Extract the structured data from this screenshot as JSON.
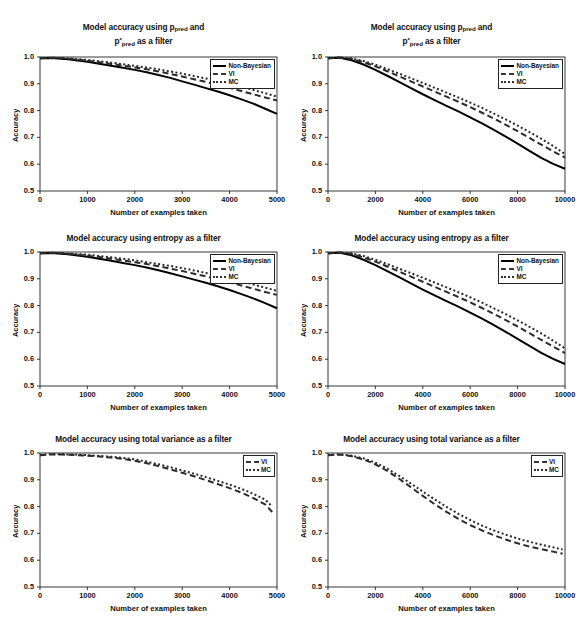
{
  "figure": {
    "axis_labels": {
      "x": "Number of examples taken",
      "y": "Accuracy"
    },
    "series_names": {
      "nonbayes": "Non-Bayesian",
      "vi": "VI",
      "mc": "MC"
    }
  },
  "titles": {
    "ppred_line1_a": "Model accuracy using p",
    "ppred_line1_sub": "pred",
    "ppred_line1_b": " and",
    "ppred_line2_a": "p",
    "ppred_line2_sup": "*",
    "ppred_line2_sub": "pred",
    "ppred_line2_b": " as a filter",
    "entropy": "Model accuracy using entropy as a filter",
    "variance": "Model accuracy using total variance as a filter"
  },
  "ticks": {
    "y": [
      "1.0",
      "0.9",
      "0.8",
      "0.7",
      "0.6",
      "0.5"
    ],
    "x5000": [
      "0",
      "1000",
      "2000",
      "3000",
      "4000",
      "5000"
    ],
    "x10000": [
      "0",
      "2000",
      "4000",
      "6000",
      "8000",
      "10000"
    ]
  },
  "chart_data": [
    {
      "id": "ppred-5000",
      "type": "line",
      "title": "Model accuracy using p_pred and p*_pred as a filter",
      "xlabel": "Number of examples taken",
      "ylabel": "Accuracy",
      "xlim": [
        0,
        5000
      ],
      "ylim": [
        0.5,
        1.0
      ],
      "xticks": [
        0,
        1000,
        2000,
        3000,
        4000,
        5000
      ],
      "yticks": [
        0.5,
        0.6,
        0.7,
        0.8,
        0.9,
        1.0
      ],
      "grid": false,
      "legend_position": "top-right",
      "x": [
        0,
        250,
        500,
        750,
        1000,
        1250,
        1500,
        1750,
        2000,
        2250,
        2500,
        2750,
        3000,
        3250,
        3500,
        3750,
        4000,
        4250,
        4500,
        4750,
        5000
      ],
      "series": [
        {
          "name": "Non-Bayesian",
          "style": "solid",
          "values": [
            0.995,
            0.996,
            0.993,
            0.988,
            0.982,
            0.975,
            0.967,
            0.96,
            0.952,
            0.943,
            0.933,
            0.922,
            0.909,
            0.897,
            0.884,
            0.871,
            0.857,
            0.842,
            0.826,
            0.807,
            0.788
          ]
        },
        {
          "name": "VI",
          "style": "dashed",
          "values": [
            0.995,
            0.997,
            0.995,
            0.991,
            0.986,
            0.98,
            0.974,
            0.968,
            0.961,
            0.954,
            0.946,
            0.937,
            0.927,
            0.917,
            0.907,
            0.896,
            0.885,
            0.873,
            0.861,
            0.849,
            0.838
          ]
        },
        {
          "name": "MC",
          "style": "dotted",
          "values": [
            0.995,
            0.997,
            0.996,
            0.993,
            0.989,
            0.984,
            0.979,
            0.973,
            0.967,
            0.961,
            0.954,
            0.946,
            0.938,
            0.929,
            0.92,
            0.91,
            0.9,
            0.889,
            0.877,
            0.865,
            0.852
          ]
        }
      ]
    },
    {
      "id": "ppred-10000",
      "type": "line",
      "title": "Model accuracy using p_pred and p*_pred as a filter",
      "xlabel": "Number of examples taken",
      "ylabel": "Accuracy",
      "xlim": [
        0,
        10000
      ],
      "ylim": [
        0.5,
        1.0
      ],
      "xticks": [
        0,
        2000,
        4000,
        6000,
        8000,
        10000
      ],
      "yticks": [
        0.5,
        0.6,
        0.7,
        0.8,
        0.9,
        1.0
      ],
      "grid": false,
      "legend_position": "top-right",
      "x": [
        0,
        500,
        1000,
        1500,
        2000,
        2500,
        3000,
        3500,
        4000,
        4500,
        5000,
        5500,
        6000,
        6500,
        7000,
        7500,
        8000,
        8500,
        9000,
        9500,
        10000
      ],
      "series": [
        {
          "name": "Non-Bayesian",
          "style": "solid",
          "values": [
            0.995,
            0.997,
            0.988,
            0.972,
            0.952,
            0.93,
            0.907,
            0.884,
            0.861,
            0.839,
            0.818,
            0.797,
            0.775,
            0.752,
            0.728,
            0.703,
            0.677,
            0.65,
            0.624,
            0.601,
            0.583
          ]
        },
        {
          "name": "VI",
          "style": "dashed",
          "values": [
            0.995,
            0.998,
            0.993,
            0.981,
            0.965,
            0.947,
            0.928,
            0.909,
            0.89,
            0.871,
            0.852,
            0.833,
            0.813,
            0.792,
            0.77,
            0.747,
            0.723,
            0.698,
            0.673,
            0.648,
            0.625
          ]
        },
        {
          "name": "MC",
          "style": "dotted",
          "values": [
            0.995,
            0.998,
            0.995,
            0.985,
            0.971,
            0.955,
            0.938,
            0.921,
            0.903,
            0.885,
            0.867,
            0.849,
            0.83,
            0.81,
            0.789,
            0.767,
            0.744,
            0.72,
            0.695,
            0.668,
            0.638
          ]
        }
      ]
    },
    {
      "id": "entropy-5000",
      "type": "line",
      "title": "Model accuracy using entropy as a filter",
      "xlabel": "Number of examples taken",
      "ylabel": "Accuracy",
      "xlim": [
        0,
        5000
      ],
      "ylim": [
        0.5,
        1.0
      ],
      "xticks": [
        0,
        1000,
        2000,
        3000,
        4000,
        5000
      ],
      "yticks": [
        0.5,
        0.6,
        0.7,
        0.8,
        0.9,
        1.0
      ],
      "grid": false,
      "legend_position": "top-right",
      "x": [
        0,
        250,
        500,
        750,
        1000,
        1250,
        1500,
        1750,
        2000,
        2250,
        2500,
        2750,
        3000,
        3250,
        3500,
        3750,
        4000,
        4250,
        4500,
        4750,
        5000
      ],
      "series": [
        {
          "name": "Non-Bayesian",
          "style": "solid",
          "values": [
            0.995,
            0.996,
            0.993,
            0.988,
            0.982,
            0.975,
            0.967,
            0.959,
            0.951,
            0.942,
            0.932,
            0.921,
            0.909,
            0.897,
            0.885,
            0.872,
            0.858,
            0.843,
            0.827,
            0.809,
            0.79
          ]
        },
        {
          "name": "VI",
          "style": "dashed",
          "values": [
            0.995,
            0.997,
            0.995,
            0.991,
            0.986,
            0.981,
            0.975,
            0.968,
            0.962,
            0.955,
            0.947,
            0.938,
            0.929,
            0.919,
            0.909,
            0.898,
            0.887,
            0.875,
            0.863,
            0.851,
            0.84
          ]
        },
        {
          "name": "MC",
          "style": "dotted",
          "values": [
            0.995,
            0.997,
            0.996,
            0.993,
            0.99,
            0.985,
            0.98,
            0.975,
            0.969,
            0.962,
            0.955,
            0.948,
            0.94,
            0.931,
            0.922,
            0.912,
            0.902,
            0.891,
            0.879,
            0.867,
            0.855
          ]
        }
      ]
    },
    {
      "id": "entropy-10000",
      "type": "line",
      "title": "Model accuracy using entropy as a filter",
      "xlabel": "Number of examples taken",
      "ylabel": "Accuracy",
      "xlim": [
        0,
        10000
      ],
      "ylim": [
        0.5,
        1.0
      ],
      "xticks": [
        0,
        2000,
        4000,
        6000,
        8000,
        10000
      ],
      "yticks": [
        0.5,
        0.6,
        0.7,
        0.8,
        0.9,
        1.0
      ],
      "grid": false,
      "legend_position": "top-right",
      "x": [
        0,
        500,
        1000,
        1500,
        2000,
        2500,
        3000,
        3500,
        4000,
        4500,
        5000,
        5500,
        6000,
        6500,
        7000,
        7500,
        8000,
        8500,
        9000,
        9500,
        10000
      ],
      "series": [
        {
          "name": "Non-Bayesian",
          "style": "solid",
          "values": [
            0.995,
            0.997,
            0.988,
            0.971,
            0.951,
            0.929,
            0.906,
            0.883,
            0.86,
            0.838,
            0.817,
            0.796,
            0.774,
            0.751,
            0.727,
            0.702,
            0.676,
            0.65,
            0.624,
            0.601,
            0.582
          ]
        },
        {
          "name": "VI",
          "style": "dashed",
          "values": [
            0.995,
            0.998,
            0.993,
            0.98,
            0.964,
            0.946,
            0.927,
            0.908,
            0.889,
            0.87,
            0.851,
            0.832,
            0.812,
            0.791,
            0.769,
            0.746,
            0.722,
            0.697,
            0.672,
            0.647,
            0.623
          ]
        },
        {
          "name": "MC",
          "style": "dotted",
          "values": [
            0.995,
            0.998,
            0.995,
            0.985,
            0.971,
            0.955,
            0.938,
            0.921,
            0.904,
            0.886,
            0.868,
            0.85,
            0.831,
            0.811,
            0.79,
            0.768,
            0.745,
            0.721,
            0.696,
            0.669,
            0.64
          ]
        }
      ]
    },
    {
      "id": "variance-5000",
      "type": "line",
      "title": "Model accuracy using total variance as a filter",
      "xlabel": "Number of examples taken",
      "ylabel": "Accuracy",
      "xlim": [
        0,
        5000
      ],
      "ylim": [
        0.5,
        1.0
      ],
      "xticks": [
        0,
        1000,
        2000,
        3000,
        4000,
        5000
      ],
      "yticks": [
        0.5,
        0.6,
        0.7,
        0.8,
        0.9,
        1.0
      ],
      "grid": false,
      "legend_position": "top-right",
      "x": [
        0,
        250,
        500,
        750,
        1000,
        1250,
        1500,
        1750,
        2000,
        2250,
        2500,
        2750,
        3000,
        3250,
        3500,
        3750,
        4000,
        4250,
        4500,
        4750,
        4900
      ],
      "series": [
        {
          "name": "VI",
          "style": "dashed",
          "values": [
            0.992,
            0.995,
            0.994,
            0.992,
            0.99,
            0.987,
            0.983,
            0.978,
            0.971,
            0.962,
            0.951,
            0.939,
            0.926,
            0.913,
            0.899,
            0.884,
            0.869,
            0.852,
            0.832,
            0.808,
            0.78
          ]
        },
        {
          "name": "MC",
          "style": "dotted",
          "values": [
            0.992,
            0.996,
            0.995,
            0.994,
            0.992,
            0.989,
            0.986,
            0.982,
            0.976,
            0.968,
            0.958,
            0.947,
            0.935,
            0.923,
            0.91,
            0.896,
            0.882,
            0.866,
            0.848,
            0.826,
            0.8
          ]
        }
      ]
    },
    {
      "id": "variance-10000",
      "type": "line",
      "title": "Model accuracy using total variance as a filter",
      "xlabel": "Number of examples taken",
      "ylabel": "Accuracy",
      "xlim": [
        0,
        10000
      ],
      "ylim": [
        0.5,
        1.0
      ],
      "xticks": [
        0,
        2000,
        4000,
        6000,
        8000,
        10000
      ],
      "yticks": [
        0.5,
        0.6,
        0.7,
        0.8,
        0.9,
        1.0
      ],
      "grid": false,
      "legend_position": "top-right",
      "x": [
        0,
        500,
        1000,
        1500,
        2000,
        2500,
        3000,
        3500,
        4000,
        4500,
        5000,
        5500,
        6000,
        6500,
        7000,
        7500,
        8000,
        8500,
        9000,
        9500,
        9900
      ],
      "series": [
        {
          "name": "VI",
          "style": "dashed",
          "values": [
            0.992,
            0.994,
            0.988,
            0.976,
            0.958,
            0.933,
            0.904,
            0.872,
            0.84,
            0.809,
            0.78,
            0.754,
            0.731,
            0.711,
            0.693,
            0.677,
            0.663,
            0.651,
            0.641,
            0.632,
            0.624
          ]
        },
        {
          "name": "MC",
          "style": "dotted",
          "values": [
            0.992,
            0.995,
            0.99,
            0.98,
            0.964,
            0.942,
            0.915,
            0.886,
            0.856,
            0.827,
            0.799,
            0.773,
            0.75,
            0.729,
            0.711,
            0.695,
            0.681,
            0.669,
            0.658,
            0.648,
            0.64
          ]
        }
      ]
    }
  ]
}
